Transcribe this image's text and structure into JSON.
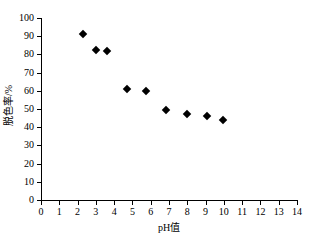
{
  "chart_data": {
    "type": "scatter",
    "title": "",
    "xlabel": "pH值",
    "ylabel": "脱色率/%",
    "xlim": [
      0,
      14
    ],
    "ylim": [
      0,
      100
    ],
    "grid": false,
    "legend": false,
    "marker": "black-diamond",
    "xticks": [
      "0",
      "1",
      "2",
      "3",
      "4",
      "5",
      "6",
      "7",
      "8",
      "9",
      "10",
      "11",
      "12",
      "13",
      "14"
    ],
    "yticks": [
      "0",
      "10",
      "20",
      "30",
      "40",
      "50",
      "60",
      "70",
      "80",
      "90",
      "100"
    ],
    "x": [
      2.3,
      3.0,
      3.6,
      4.7,
      5.75,
      6.85,
      8.0,
      9.1,
      9.95
    ],
    "values": [
      91,
      82.5,
      82,
      61,
      60,
      49.5,
      47.5,
      46,
      44
    ],
    "points": [
      {
        "x": 2.3,
        "y": 91
      },
      {
        "x": 3.0,
        "y": 82.5
      },
      {
        "x": 3.6,
        "y": 82
      },
      {
        "x": 4.7,
        "y": 61
      },
      {
        "x": 5.75,
        "y": 60
      },
      {
        "x": 6.85,
        "y": 49.5
      },
      {
        "x": 8.0,
        "y": 47.5
      },
      {
        "x": 9.1,
        "y": 46
      },
      {
        "x": 9.95,
        "y": 44
      }
    ],
    "series_color": "#000000"
  }
}
